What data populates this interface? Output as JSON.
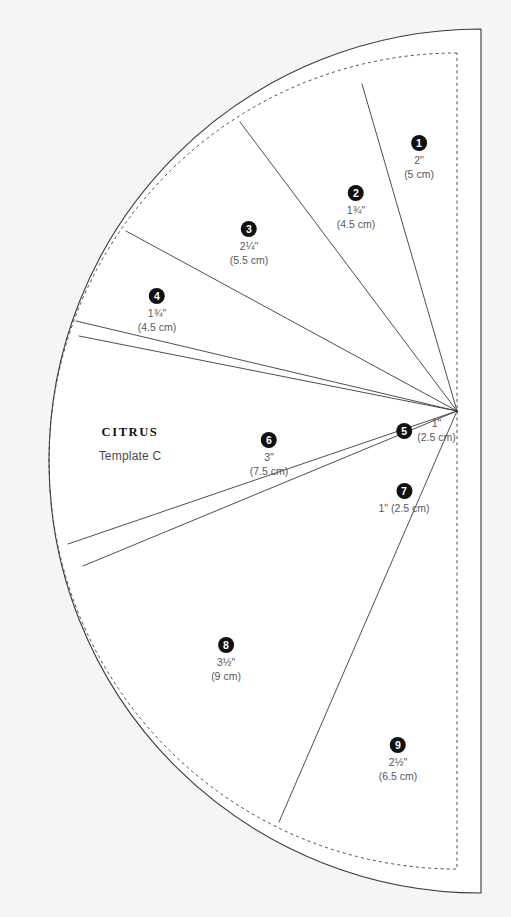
{
  "document": {
    "title": "Citrus Template C",
    "background_color": "#f5f5f3",
    "ink_color": "#333333",
    "badge_color": "#111111",
    "text_color": "#58585a"
  },
  "brand": {
    "name": "CITRUS",
    "template_label": "Template C"
  },
  "wedges": [
    {
      "number": "1",
      "imperial": "2\"",
      "metric": "(5 cm)",
      "layout": "stack",
      "x": 419,
      "y": 135
    },
    {
      "number": "2",
      "imperial": "1¾\"",
      "metric": "(4.5 cm)",
      "layout": "stack",
      "x": 356,
      "y": 185
    },
    {
      "number": "3",
      "imperial": "2¼\"",
      "metric": "(5.5 cm)",
      "layout": "stack",
      "x": 249,
      "y": 221
    },
    {
      "number": "4",
      "imperial": "1¾\"",
      "metric": "(4.5 cm)",
      "layout": "stack",
      "x": 157,
      "y": 288
    },
    {
      "number": "5",
      "imperial": "1\"",
      "metric": "(2.5 cm)",
      "layout": "row",
      "x": 426,
      "y": 417
    },
    {
      "number": "6",
      "imperial": "3\"",
      "metric": "(7.5 cm)",
      "layout": "stack",
      "x": 269,
      "y": 432
    },
    {
      "number": "7",
      "imperial": "1\" (2.5 cm)",
      "metric": "",
      "layout": "inline-below",
      "x": 404,
      "y": 483
    },
    {
      "number": "8",
      "imperial": "3½\"",
      "metric": "(9 cm)",
      "layout": "stack",
      "x": 226,
      "y": 637
    },
    {
      "number": "9",
      "imperial": "2½\"",
      "metric": "(6.5 cm)",
      "layout": "stack",
      "x": 398,
      "y": 737
    }
  ]
}
